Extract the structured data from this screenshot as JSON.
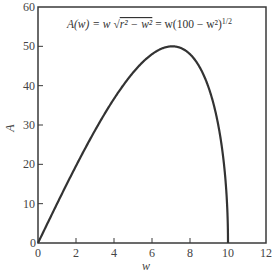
{
  "chart_data": {
    "type": "line",
    "title": "",
    "annotation": "A(w) = w √(r² − w²) = w(100 − w²)^1/2",
    "annotation_parts": {
      "lhs": "A(w) = w ",
      "sqrt_body": "r² − w²",
      "rhs": " = w(100 − w²)",
      "exponent": "1/2"
    },
    "xlabel": "w",
    "ylabel": "A",
    "xlim": [
      0,
      12
    ],
    "ylim": [
      0,
      60
    ],
    "xticks": [
      0,
      2,
      4,
      6,
      8,
      10,
      12
    ],
    "yticks": [
      0,
      10,
      20,
      30,
      40,
      50,
      60
    ],
    "grid": false,
    "legend": null,
    "series": [
      {
        "name": "A(w)",
        "x": [
          0,
          1,
          2,
          3,
          4,
          5,
          6,
          7,
          7.07,
          8,
          9,
          9.5,
          9.8,
          10
        ],
        "y": [
          0,
          9.95,
          19.6,
          28.62,
          36.66,
          43.3,
          48.0,
          49.99,
          50.0,
          48.0,
          39.23,
          29.66,
          19.7,
          0
        ]
      }
    ],
    "vertical_segment": {
      "x": 10,
      "from": 0,
      "to": 0,
      "note": "curve drops vertically to w=10"
    }
  }
}
